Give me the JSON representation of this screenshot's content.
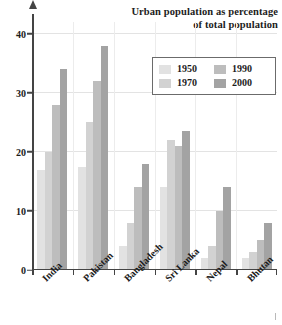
{
  "chart_data": {
    "type": "bar",
    "title": "Urban population as percentage of total population",
    "title_lines": [
      "Urban population as percentage",
      "of total population"
    ],
    "xlabel": "",
    "ylabel": "",
    "ylim": [
      0,
      42
    ],
    "yticks": [
      0,
      10,
      20,
      30,
      40
    ],
    "ytick_labels": [
      "0",
      "10",
      "20",
      "30",
      "40"
    ],
    "grid": true,
    "legend_position": "upper right",
    "categories": [
      "India",
      "Pakistan",
      "Bangladesh",
      "Sri Lanka",
      "Nepal",
      "Bhutan"
    ],
    "series": [
      {
        "name": "1950",
        "color": "#e2e2e2",
        "values": [
          17,
          17.5,
          4,
          14,
          2,
          2
        ]
      },
      {
        "name": "1970",
        "color": "#d2d2d2",
        "values": [
          20,
          25,
          8,
          22,
          4,
          3
        ]
      },
      {
        "name": "1990",
        "color": "#bdbdbd",
        "values": [
          28,
          32,
          14,
          21,
          10,
          5
        ]
      },
      {
        "name": "2000",
        "color": "#a3a3a3",
        "values": [
          34,
          38,
          18,
          23.5,
          14,
          8
        ]
      }
    ]
  },
  "legend": {
    "entries": [
      {
        "label": "1950",
        "color": "#e2e2e2"
      },
      {
        "label": "1990",
        "color": "#bdbdbd"
      },
      {
        "label": "1970",
        "color": "#d2d2d2"
      },
      {
        "label": "2000",
        "color": "#a3a3a3"
      }
    ]
  },
  "axis": {
    "y_ticks": [
      "0",
      "10",
      "20",
      "30",
      "40"
    ]
  }
}
